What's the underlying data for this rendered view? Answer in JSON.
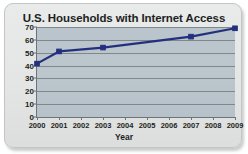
{
  "chart_data": {
    "type": "line",
    "title": "U.S. Households with Internet Access",
    "xlabel": "Year",
    "ylabel": "Percent with Internet",
    "x": [
      2000,
      2001,
      2003,
      2007,
      2009
    ],
    "values": [
      41.5,
      51.0,
      54.0,
      62.5,
      69.0
    ],
    "series": [
      {
        "name": "Percent with Internet",
        "color": "#24307e",
        "marker": "square",
        "points": [
          {
            "x": 2000,
            "y": 41.5
          },
          {
            "x": 2001,
            "y": 51.0
          },
          {
            "x": 2003,
            "y": 54.0
          },
          {
            "x": 2007,
            "y": 62.5
          },
          {
            "x": 2009,
            "y": 69.0
          }
        ]
      }
    ],
    "xlim": [
      2000,
      2009
    ],
    "ylim": [
      0,
      70
    ],
    "xticks": [
      "2000",
      "2001",
      "2002",
      "2003",
      "2004",
      "2005",
      "2006",
      "2007",
      "2008",
      "2009"
    ],
    "yticks": [
      "0",
      "10",
      "20",
      "30",
      "40",
      "50",
      "60",
      "70"
    ],
    "grid": "horizontal",
    "legend": "none",
    "colors": {
      "series_line": "#24307e",
      "plot_background": "#bcc6cd",
      "gridline": "#7f878b",
      "axis": "#6d7478",
      "card_background": "#e4e5e5",
      "card_border": "#c3c5c6",
      "text": "#1d1f22"
    }
  }
}
